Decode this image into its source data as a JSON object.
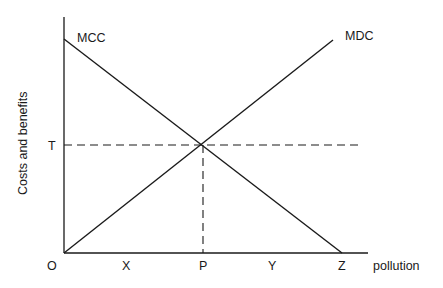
{
  "diagram": {
    "y_axis_label": "Costs and benefits",
    "x_axis_label": "pollution",
    "origin_label": "O",
    "curves": [
      {
        "name": "MCC",
        "label": "MCC",
        "slope": "downward",
        "from": [
          64,
          39
        ],
        "to": [
          342,
          253
        ]
      },
      {
        "name": "MDC",
        "label": "MDC",
        "slope": "upward",
        "from": [
          64,
          253
        ],
        "to": [
          333,
          40
        ]
      }
    ],
    "equilibrium": {
      "x_label": "P",
      "y_label": "T",
      "point": [
        203,
        145
      ]
    },
    "x_ticks": [
      "X",
      "P",
      "Y",
      "Z"
    ],
    "y_ticks": [
      "T"
    ],
    "labels": {
      "O": "O",
      "X": "X",
      "P": "P",
      "Y": "Y",
      "Z": "Z",
      "T": "T",
      "MCC": "MCC",
      "MDC": "MDC",
      "pollution": "pollution",
      "ylabel": "Costs and benefits"
    },
    "colors": {
      "line": "#1a1a1a",
      "background": "#ffffff"
    }
  }
}
